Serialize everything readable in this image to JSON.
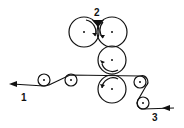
{
  "diagram": {
    "labels": {
      "exit": "1",
      "nip": "2",
      "entry": "3"
    },
    "rollers": [
      {
        "id": "top-left",
        "cx": 84,
        "cy": 32,
        "r": 15
      },
      {
        "id": "top-right",
        "cx": 112,
        "cy": 32,
        "r": 15
      },
      {
        "id": "middle",
        "cx": 112,
        "cy": 60,
        "r": 14
      },
      {
        "id": "bottom",
        "cx": 112,
        "cy": 89,
        "r": 14
      },
      {
        "id": "guide-1",
        "cx": 44,
        "cy": 80,
        "r": 6
      },
      {
        "id": "guide-2",
        "cx": 71,
        "cy": 80,
        "r": 6
      },
      {
        "id": "guide-3",
        "cx": 140,
        "cy": 82,
        "r": 6
      },
      {
        "id": "guide-4",
        "cx": 143,
        "cy": 103,
        "r": 6
      }
    ],
    "line_color": "#111111"
  }
}
